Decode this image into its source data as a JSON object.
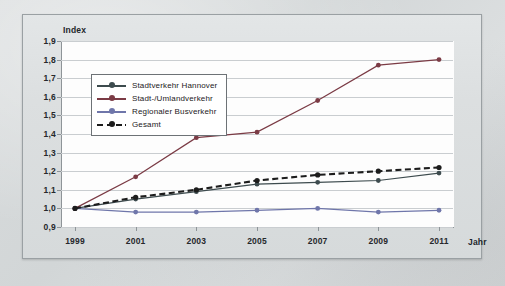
{
  "chart": {
    "y_axis_title": "Index",
    "x_axis_title": "Jahr",
    "watermark": "",
    "legend": {
      "items": [
        {
          "label": "Stadtverkehr Hannover",
          "color": "#3d4b4e",
          "style": "solid"
        },
        {
          "label": "Stadt-/Umlandverkehr",
          "color": "#7b3b45",
          "style": "solid"
        },
        {
          "label": "Regionaler Busverkehr",
          "color": "#6f76aa",
          "style": "solid"
        },
        {
          "label": "Gesamt",
          "color": "#1c1c1c",
          "style": "dashed"
        }
      ]
    }
  },
  "chart_data": {
    "type": "line",
    "title": "",
    "xlabel": "Jahr",
    "ylabel": "Index",
    "grid": true,
    "legend_position": "top-left-inside",
    "x": [
      1999,
      2001,
      2003,
      2005,
      2007,
      2009,
      2011
    ],
    "categories": [
      "1999",
      "2001",
      "2003",
      "2005",
      "2007",
      "2009",
      "2011"
    ],
    "xlim": [
      1999,
      2011
    ],
    "ylim": [
      0.9,
      1.9
    ],
    "yticks": [
      "0,9",
      "1,0",
      "1,1",
      "1,2",
      "1,3",
      "1,4",
      "1,5",
      "1,6",
      "1,7",
      "1,8",
      "1,9"
    ],
    "ytick_values": [
      0.9,
      1.0,
      1.1,
      1.2,
      1.3,
      1.4,
      1.5,
      1.6,
      1.7,
      1.8,
      1.9
    ],
    "series": [
      {
        "name": "Stadtverkehr Hannover",
        "color": "#3d4b4e",
        "style": "solid",
        "values": [
          1.0,
          1.05,
          1.09,
          1.13,
          1.14,
          1.15,
          1.19
        ]
      },
      {
        "name": "Stadt-/Umlandverkehr",
        "color": "#7b3b45",
        "style": "solid",
        "values": [
          1.0,
          1.17,
          1.38,
          1.41,
          1.58,
          1.77,
          1.8
        ]
      },
      {
        "name": "Regionaler Busverkehr",
        "color": "#6f76aa",
        "style": "solid",
        "values": [
          1.0,
          0.98,
          0.98,
          0.99,
          1.0,
          0.98,
          0.99
        ]
      },
      {
        "name": "Gesamt",
        "color": "#1c1c1c",
        "style": "dashed",
        "values": [
          1.0,
          1.06,
          1.1,
          1.15,
          1.18,
          1.2,
          1.22
        ]
      }
    ]
  }
}
